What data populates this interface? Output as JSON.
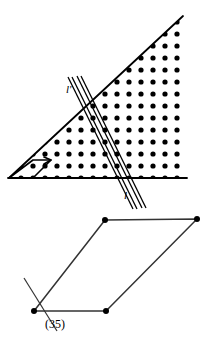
{
  "figure": {
    "background_color": "#ffffff",
    "ink_color": "#000000",
    "labels": {
      "line_l": "l",
      "line_l_translated": "l'",
      "equation_number": "(35)"
    },
    "upper_figure": {
      "name": "lattice-triangle",
      "description": "Right triangle filled with a square lattice of dots, crossed by a pair of parallel lines",
      "triangle_vertices": [
        {
          "x": 183,
          "y": 16
        },
        {
          "x": 9,
          "y": 178
        },
        {
          "x": 186,
          "y": 178
        }
      ],
      "drawn_edges": [
        "hypotenuse",
        "base"
      ],
      "lattice": {
        "spacing_x": 12,
        "spacing_y": 12,
        "dot_radius": 2.6,
        "origin_x": 9,
        "origin_y": 178
      },
      "band_lines": [
        {
          "name": "l",
          "x1": 141,
          "y1": 206,
          "x2": 77,
          "y2": 75
        },
        {
          "name": "l-prime",
          "x1": 132,
          "y1": 208,
          "x2": 68,
          "y2": 77
        }
      ],
      "corner_motif": {
        "name": "bottom-left-parallelogram-arrow",
        "points": [
          {
            "x": 9,
            "y": 178
          },
          {
            "x": 33,
            "y": 160
          },
          {
            "x": 51,
            "y": 160
          },
          {
            "x": 33,
            "y": 178
          }
        ]
      }
    },
    "lower_figure": {
      "name": "parallelogram",
      "vertices": [
        {
          "x": 105,
          "y": 220
        },
        {
          "x": 197,
          "y": 219
        },
        {
          "x": 106,
          "y": 311
        },
        {
          "x": 34,
          "y": 311
        }
      ],
      "vertex_dot_radius": 3.0,
      "crossing_line": {
        "x1": 24,
        "y1": 278,
        "x2": 56,
        "y2": 330
      }
    }
  }
}
